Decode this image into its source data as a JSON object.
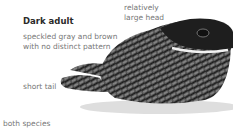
{
  "figure": {
    "title": "Dark adult",
    "description_line1": "speckled gray and brown",
    "description_line2": "with no distinct pattern",
    "head_label_line1": "relatively",
    "head_label_line2": "large head",
    "tail_label": "short tail",
    "footer": "both species",
    "illustration": "nightjar-bird-illustration",
    "colors": {
      "text_dark": "#2a2a2a",
      "text_gray": "#777777",
      "bird_dark": "#1e1e1e",
      "bird_mid": "#6a6a6a",
      "shadow": "#cfcfcf"
    }
  }
}
